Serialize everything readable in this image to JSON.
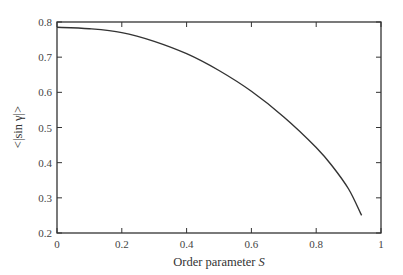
{
  "chart_data": {
    "type": "line",
    "title": "",
    "xlabel": "Order parameter S",
    "ylabel": "<|sin γ|>",
    "xlim": [
      0,
      1
    ],
    "ylim": [
      0.2,
      0.8
    ],
    "grid": false,
    "legend": null,
    "x_ticks": [
      "0",
      "0.2",
      "0.4",
      "0.6",
      "0.8",
      "1"
    ],
    "y_ticks": [
      "0.2",
      "0.3",
      "0.4",
      "0.5",
      "0.6",
      "0.7",
      "0.8"
    ],
    "series": [
      {
        "name": "<|sin γ|>",
        "x": [
          0,
          0.1,
          0.2,
          0.3,
          0.4,
          0.5,
          0.6,
          0.7,
          0.8,
          0.85,
          0.9,
          0.94
        ],
        "values": [
          0.785,
          0.781,
          0.77,
          0.745,
          0.71,
          0.662,
          0.603,
          0.53,
          0.443,
          0.39,
          0.325,
          0.25
        ]
      }
    ]
  },
  "labels": {
    "xlabel_text": "Order parameter ",
    "xlabel_symbol": "S",
    "ylabel": "<|sin γ|>"
  }
}
